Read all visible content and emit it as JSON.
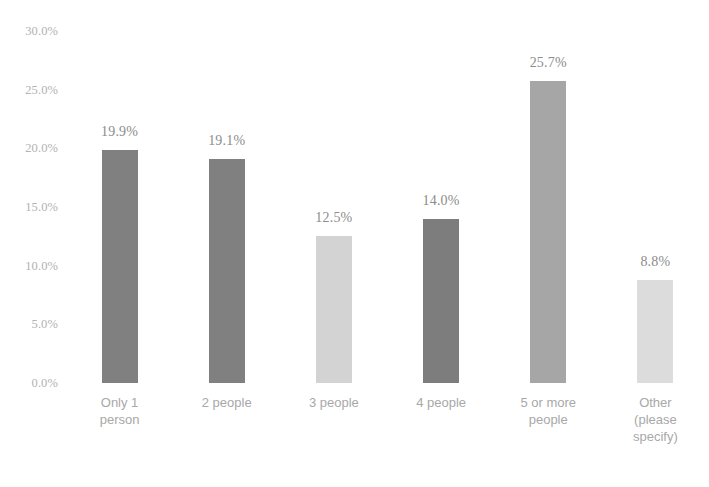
{
  "chart_data": {
    "type": "bar",
    "title": "",
    "subtitle": "",
    "xlabel": "",
    "ylabel": "",
    "categories": [
      "Only 1\nperson",
      "2 people",
      "3 people",
      "4 people",
      "5 or more\npeople",
      "Other\n(please\nspecify)"
    ],
    "values": [
      19.9,
      19.1,
      12.5,
      14.0,
      25.7,
      8.8
    ],
    "data_labels": [
      "19.9%",
      "19.1%",
      "12.5%",
      "14.0%",
      "25.7%",
      "8.8%"
    ],
    "bar_colors": [
      "#808080",
      "#808080",
      "#d3d3d3",
      "#7d7d7d",
      "#a6a6a6",
      "#dcdcdc"
    ],
    "ylim": [
      0,
      30
    ],
    "ytick_values": [
      0,
      5,
      10,
      15,
      20,
      25,
      30
    ],
    "ytick_labels": [
      "0.0%",
      "5.0%",
      "10.0%",
      "15.0%",
      "20.0%",
      "25.0%",
      "30.0%"
    ],
    "grid": false,
    "legend": null,
    "legend_position": "none",
    "axis_line": false
  },
  "axis": {
    "tick_label_color": "#b2b2b2",
    "category_label_color": "#a8a8a8",
    "value_label_color": "#8c8c8c"
  }
}
